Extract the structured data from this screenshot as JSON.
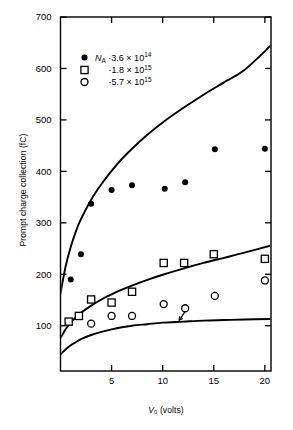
{
  "figure": {
    "background": "#ffffff",
    "ink": "#000000"
  },
  "axes": {
    "y_title": "Prompt charge collection (fC)",
    "x_title_var": "V",
    "x_title_sub": "0",
    "x_title_unit": "(volts)",
    "y_ticks": [
      100,
      200,
      300,
      400,
      500,
      600,
      700
    ],
    "x_ticks": [
      5,
      10,
      15,
      20
    ],
    "ylim": [
      12,
      700
    ],
    "xlim": [
      0,
      20.6
    ]
  },
  "legend": {
    "symbol_var": "N",
    "symbol_sub": "A",
    "entries": [
      {
        "marker": "filled-circle",
        "prefix": "·",
        "mantissa": "3.6",
        "times": "×",
        "base": "10",
        "exponent": "14",
        "value": 360000000000000.0
      },
      {
        "marker": "open-square",
        "prefix": "·",
        "mantissa": "1.8",
        "times": "×",
        "base": "10",
        "exponent": "15",
        "value": 1800000000000000.0
      },
      {
        "marker": "open-circle",
        "prefix": "·",
        "mantissa": "5.7",
        "times": "×",
        "base": "10",
        "exponent": "15",
        "value": 5700000000000000.0
      }
    ]
  },
  "chart_data": {
    "type": "scatter",
    "title": "",
    "xlabel": "V0 (volts)",
    "ylabel": "Prompt charge collection (fC)",
    "xlim": [
      0,
      20.6
    ],
    "ylim": [
      12,
      700
    ],
    "grid": false,
    "legend_position": "upper-left-inside",
    "series": [
      {
        "name": "NA = 3.6 x 10^14",
        "marker": "filled-circle",
        "points": [
          {
            "x": 1.0,
            "y": 190
          },
          {
            "x": 2.0,
            "y": 239
          },
          {
            "x": 3.0,
            "y": 337
          },
          {
            "x": 5.0,
            "y": 364
          },
          {
            "x": 7.0,
            "y": 373
          },
          {
            "x": 10.2,
            "y": 366
          },
          {
            "x": 12.2,
            "y": 379
          },
          {
            "x": 15.1,
            "y": 443
          },
          {
            "x": 20.0,
            "y": 444
          }
        ]
      },
      {
        "name": "NA = 1.8 x 10^15",
        "marker": "open-square",
        "points": [
          {
            "x": 0.8,
            "y": 108
          },
          {
            "x": 1.8,
            "y": 119
          },
          {
            "x": 3.0,
            "y": 151
          },
          {
            "x": 5.0,
            "y": 145
          },
          {
            "x": 7.0,
            "y": 166
          },
          {
            "x": 10.1,
            "y": 222
          },
          {
            "x": 12.1,
            "y": 222
          },
          {
            "x": 15.0,
            "y": 239
          },
          {
            "x": 20.0,
            "y": 230
          }
        ]
      },
      {
        "name": "NA = 5.7 x 10^15",
        "marker": "open-circle",
        "points": [
          {
            "x": 3.0,
            "y": 104
          },
          {
            "x": 5.0,
            "y": 119
          },
          {
            "x": 7.0,
            "y": 119
          },
          {
            "x": 10.1,
            "y": 142
          },
          {
            "x": 12.2,
            "y": 134
          },
          {
            "x": 15.1,
            "y": 158
          },
          {
            "x": 20.0,
            "y": 188
          }
        ]
      }
    ],
    "model_curves": [
      {
        "name": "model NA = 3.6 x 10^14",
        "points": [
          {
            "x": 0.0,
            "y": 163
          },
          {
            "x": 0.5,
            "y": 215
          },
          {
            "x": 1.0,
            "y": 253
          },
          {
            "x": 1.5,
            "y": 283
          },
          {
            "x": 2.0,
            "y": 307
          },
          {
            "x": 3.0,
            "y": 345
          },
          {
            "x": 4.0,
            "y": 375
          },
          {
            "x": 5.0,
            "y": 401
          },
          {
            "x": 6.0,
            "y": 424
          },
          {
            "x": 7.0,
            "y": 444
          },
          {
            "x": 8.5,
            "y": 471
          },
          {
            "x": 10.0,
            "y": 495
          },
          {
            "x": 12.0,
            "y": 523
          },
          {
            "x": 14.0,
            "y": 549
          },
          {
            "x": 16.0,
            "y": 573
          },
          {
            "x": 18.0,
            "y": 597
          },
          {
            "x": 20.6,
            "y": 645
          }
        ]
      },
      {
        "name": "model NA = 1.8 x 10^15",
        "points": [
          {
            "x": 0.0,
            "y": 76
          },
          {
            "x": 0.5,
            "y": 93
          },
          {
            "x": 1.0,
            "y": 106
          },
          {
            "x": 1.5,
            "y": 116
          },
          {
            "x": 2.0,
            "y": 125
          },
          {
            "x": 3.0,
            "y": 139
          },
          {
            "x": 4.0,
            "y": 151
          },
          {
            "x": 5.0,
            "y": 161
          },
          {
            "x": 6.0,
            "y": 170
          },
          {
            "x": 7.0,
            "y": 178
          },
          {
            "x": 8.5,
            "y": 189
          },
          {
            "x": 10.0,
            "y": 199
          },
          {
            "x": 12.0,
            "y": 211
          },
          {
            "x": 14.0,
            "y": 222
          },
          {
            "x": 16.0,
            "y": 232
          },
          {
            "x": 18.0,
            "y": 242
          },
          {
            "x": 20.6,
            "y": 256
          }
        ]
      },
      {
        "name": "model NA = 5.7 x 10^15",
        "points": [
          {
            "x": 0.0,
            "y": 44
          },
          {
            "x": 0.5,
            "y": 54
          },
          {
            "x": 1.0,
            "y": 62
          },
          {
            "x": 1.5,
            "y": 68
          },
          {
            "x": 2.0,
            "y": 74
          },
          {
            "x": 3.0,
            "y": 82
          },
          {
            "x": 4.0,
            "y": 88
          },
          {
            "x": 5.0,
            "y": 93
          },
          {
            "x": 6.0,
            "y": 97
          },
          {
            "x": 7.0,
            "y": 100
          },
          {
            "x": 8.5,
            "y": 103
          },
          {
            "x": 10.0,
            "y": 106
          },
          {
            "x": 12.0,
            "y": 108
          },
          {
            "x": 14.0,
            "y": 110
          },
          {
            "x": 16.0,
            "y": 111
          },
          {
            "x": 18.0,
            "y": 112
          },
          {
            "x": 20.6,
            "y": 113
          }
        ]
      }
    ],
    "annotations": [
      {
        "type": "arrow",
        "name": "curve-callout-arrow",
        "from": {
          "x": 11.6,
          "y": 110
        },
        "to": {
          "x": 12.2,
          "y": 128
        }
      }
    ]
  }
}
